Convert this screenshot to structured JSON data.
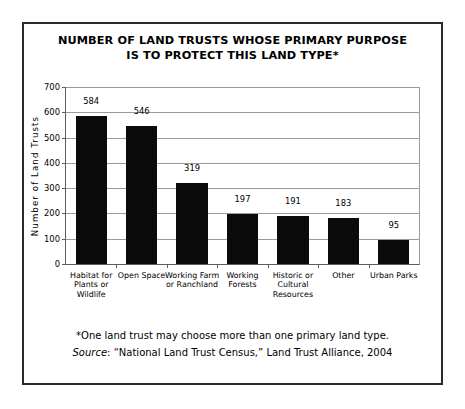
{
  "chart_data": {
    "type": "bar",
    "title": "NUMBER OF LAND TRUSTS WHOSE PRIMARY PURPOSE\nIS TO PROTECT THIS LAND TYPE*",
    "xlabel": "",
    "ylabel": "Number of Land Trusts",
    "ylim": [
      0,
      700
    ],
    "ytick_step": 100,
    "yticks": [
      "0",
      "100",
      "200",
      "300",
      "400",
      "500",
      "600",
      "700"
    ],
    "grid": "horizontal",
    "legend": "none",
    "bar_color": "#0b0b0b",
    "categories": [
      "Habitat for\nPlants or\nWildlife",
      "Open Space",
      "Working Farm\nor Ranchland",
      "Working\nForests",
      "Historic or\nCultural\nResources",
      "Other",
      "Urban Parks"
    ],
    "values": [
      584,
      546,
      319,
      197,
      191,
      183,
      95
    ],
    "value_labels": [
      "584",
      "546",
      "319",
      "197",
      "191",
      "183",
      "95"
    ]
  },
  "footnotes": {
    "note": "*One land trust may choose more than one primary land type.",
    "source_label": "Source",
    "source_text": ": “National Land Trust Census,” Land Trust Alliance, 2004"
  }
}
